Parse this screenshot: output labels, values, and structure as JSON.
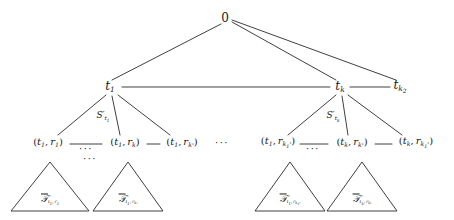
{
  "figure": {
    "type": "tree-diagram",
    "width": 454,
    "height": 220,
    "background": "#ffffff",
    "stroke_color": "#2a2a2a"
  },
  "nodes": {
    "root": {
      "label": "0",
      "x": 225,
      "y": 18
    },
    "level1": [
      {
        "id": "t1",
        "label_main": "t",
        "label_sub": "1",
        "x": 110,
        "y": 87
      },
      {
        "id": "tk",
        "label_main": "t",
        "label_sub": "k",
        "x": 340,
        "y": 87
      },
      {
        "id": "tk2",
        "label_main": "t",
        "label_sub": "k",
        "label_subsub": "2",
        "x": 400,
        "y": 87
      }
    ],
    "edge_labels": [
      {
        "id": "S-t1",
        "prime": "S'",
        "sub": "t",
        "subsub": "1",
        "x": 103,
        "y": 117
      },
      {
        "id": "S-tk",
        "prime": "S'",
        "sub": "t",
        "subsub": "k",
        "x": 333,
        "y": 117
      }
    ],
    "leaves": [
      {
        "id": "t1r1",
        "text": "(t₁, r₁)",
        "x": 48,
        "y": 143
      },
      {
        "id": "t1rk",
        "text": "(t₁, rₖ)",
        "x": 125,
        "y": 143
      },
      {
        "id": "t1rkstar",
        "text": "(t₁, rₖ*)",
        "x": 182,
        "y": 143
      },
      {
        "id": "t1rk1star",
        "text": "(t₁, rₖ₁*)",
        "x": 278,
        "y": 143
      },
      {
        "id": "tkrkstar",
        "text": "(tₖ, rₖ*)",
        "x": 352,
        "y": 143
      },
      {
        "id": "tkrk1star",
        "text": "(tₖ, rₖ₁*)",
        "x": 416,
        "y": 143
      }
    ],
    "ellipses": [
      {
        "id": "dots-leaf-left",
        "text": "···",
        "x": 86,
        "y": 147
      },
      {
        "id": "dots-leaf-mid",
        "text": "···",
        "x": 222,
        "y": 141
      },
      {
        "id": "dots-leaf-right",
        "text": "···",
        "x": 312,
        "y": 147
      },
      {
        "id": "dots-triangle-top",
        "text": "···",
        "x": 90,
        "y": 157
      }
    ],
    "triangles": [
      {
        "id": "tri-t1r1",
        "cx": 50,
        "apex_y": 162,
        "base_y": 211,
        "half_w": 39,
        "label_x": 50,
        "label_y": 200
      },
      {
        "id": "tri-t1rkstar",
        "cx": 128,
        "apex_y": 162,
        "base_y": 211,
        "half_w": 35,
        "label_x": 128,
        "label_y": 200
      },
      {
        "id": "tri-t1rk1star",
        "cx": 290,
        "apex_y": 162,
        "base_y": 211,
        "half_w": 35,
        "label_x": 290,
        "label_y": 200
      },
      {
        "id": "tri-tkrkstar",
        "cx": 362,
        "apex_y": 162,
        "base_y": 211,
        "half_w": 35,
        "label_x": 362,
        "label_y": 200
      }
    ],
    "triangle_labels": [
      {
        "id": "lbl-tri-1",
        "symbol": "T",
        "sub": "t₁, r₁"
      },
      {
        "id": "lbl-tri-2",
        "symbol": "T",
        "sub": "t₁, rₖ*"
      },
      {
        "id": "lbl-tri-3",
        "symbol": "T",
        "sub": "t₁, rₖ₁*"
      },
      {
        "id": "lbl-tri-4",
        "symbol": "T",
        "sub": "tₖ, rₖ*"
      }
    ]
  },
  "edges": [
    {
      "from": "root",
      "to": "t1",
      "x1": 221,
      "y1": 24,
      "x2": 112,
      "y2": 80
    },
    {
      "from": "root",
      "to": "tk",
      "x1": 232,
      "y1": 22,
      "x2": 336,
      "y2": 80
    },
    {
      "from": "root",
      "to": "tk2",
      "x1": 232,
      "y1": 20,
      "x2": 396,
      "y2": 80
    },
    {
      "from": "t1",
      "to": "tk",
      "x1": 122,
      "y1": 87,
      "x2": 330,
      "y2": 87
    },
    {
      "from": "tk",
      "to": "tk2",
      "x1": 350,
      "y1": 87,
      "x2": 390,
      "y2": 87
    },
    {
      "from": "t1",
      "to": "t1r1",
      "x1": 106,
      "y1": 95,
      "x2": 58,
      "y2": 135
    },
    {
      "from": "t1",
      "to": "t1rk",
      "x1": 112,
      "y1": 96,
      "x2": 120,
      "y2": 135
    },
    {
      "from": "t1",
      "to": "t1rkstar",
      "x1": 118,
      "y1": 95,
      "x2": 170,
      "y2": 135
    },
    {
      "from": "tk",
      "to": "t1rk1star",
      "x1": 336,
      "y1": 95,
      "x2": 288,
      "y2": 135
    },
    {
      "from": "tk",
      "to": "tkrkstar",
      "x1": 342,
      "y1": 96,
      "x2": 348,
      "y2": 135
    },
    {
      "from": "tk",
      "to": "tkrk1star",
      "x1": 348,
      "y1": 95,
      "x2": 402,
      "y2": 135
    },
    {
      "from": "t1r1",
      "to": "t1rk",
      "x1": 70,
      "y1": 144,
      "x2": 102,
      "y2": 144
    },
    {
      "from": "t1rk",
      "to": "t1rkstar",
      "x1": 147,
      "y1": 144,
      "x2": 160,
      "y2": 144
    },
    {
      "from": "t1rk1star",
      "to": "tkrkstar",
      "x1": 300,
      "y1": 144,
      "x2": 328,
      "y2": 144
    },
    {
      "from": "tkrkstar",
      "to": "tkrk1star",
      "x1": 375,
      "y1": 144,
      "x2": 392,
      "y2": 144
    }
  ]
}
